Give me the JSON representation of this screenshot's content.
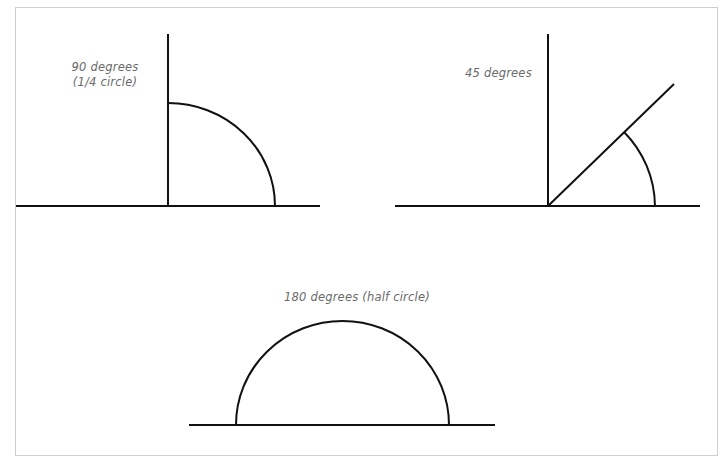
{
  "figure": {
    "panels": [
      {
        "id": "angle-90",
        "label_line1": "90 degrees",
        "label_line2": "(1/4 circle)",
        "angle_degrees": 90
      },
      {
        "id": "angle-45",
        "label_line1": "45 degrees",
        "angle_degrees": 45
      },
      {
        "id": "angle-180",
        "label_line1": "180 degrees (half circle)",
        "angle_degrees": 180
      }
    ],
    "colors": {
      "stroke": "#111111",
      "label": "#6a6a6a",
      "border": "#cfcfcf"
    }
  }
}
